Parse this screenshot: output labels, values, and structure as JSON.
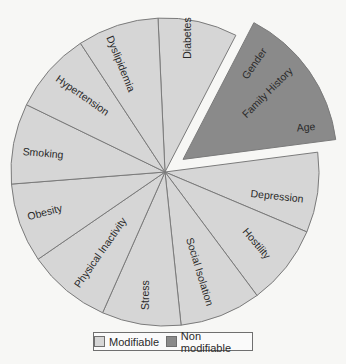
{
  "chart_data": {
    "type": "pie",
    "title": "",
    "center": [
      165,
      172
    ],
    "radius": 154,
    "exploded_offset": 22,
    "legend_position": "bottom",
    "categories": [
      "Modifiable",
      "Non modifiable"
    ],
    "colors": {
      "Modifiable": "#d6d6d6",
      "Non modifiable": "#8a8a8a"
    },
    "slices": [
      {
        "label": "Diabetes",
        "group": "Modifiable",
        "start_deg": -2.6,
        "end_deg": 27.4,
        "value": 1
      },
      {
        "label": "Gender / Family History / Age",
        "group": "Non modifiable",
        "start_deg": 27.4,
        "end_deg": 82.6,
        "value": 1.84,
        "exploded": true,
        "sub_labels": [
          "Gender",
          "Family History",
          "Age"
        ]
      },
      {
        "label": "Depression",
        "group": "Modifiable",
        "start_deg": 82.6,
        "end_deg": 112.9,
        "value": 1
      },
      {
        "label": "Hostility",
        "group": "Modifiable",
        "start_deg": 112.9,
        "end_deg": 143.3,
        "value": 1
      },
      {
        "label": "Social Isolation",
        "group": "Modifiable",
        "start_deg": 143.3,
        "end_deg": 174.0,
        "value": 1
      },
      {
        "label": "Stress",
        "group": "Modifiable",
        "start_deg": 174.0,
        "end_deg": 203.9,
        "value": 1
      },
      {
        "label": "Physical Inactivity",
        "group": "Modifiable",
        "start_deg": 203.9,
        "end_deg": 235.5,
        "value": 1
      },
      {
        "label": "Obesity",
        "group": "Modifiable",
        "start_deg": 235.5,
        "end_deg": 265.5,
        "value": 1
      },
      {
        "label": "Smoking",
        "group": "Modifiable",
        "start_deg": 265.5,
        "end_deg": 295.9,
        "value": 1
      },
      {
        "label": "Hypertension",
        "group": "Modifiable",
        "start_deg": 295.9,
        "end_deg": 326.7,
        "value": 1
      },
      {
        "label": "Dyslipidemia",
        "group": "Modifiable",
        "start_deg": 326.7,
        "end_deg": 357.4,
        "value": 1
      }
    ],
    "labels": [
      {
        "text": "Diabetes",
        "x": 188,
        "y": 38,
        "rotate": -90
      },
      {
        "text": "Dyslipidemia",
        "x": 120,
        "y": 64,
        "rotate": 68
      },
      {
        "text": "Hypertension",
        "x": 82,
        "y": 96,
        "rotate": 35
      },
      {
        "text": "Smoking",
        "x": 43,
        "y": 154,
        "rotate": 5
      },
      {
        "text": "Obesity",
        "x": 45,
        "y": 213,
        "rotate": -15
      },
      {
        "text": "Physical Inactivity",
        "x": 101,
        "y": 253,
        "rotate": -55
      },
      {
        "text": "Stress",
        "x": 146,
        "y": 295,
        "rotate": -90
      },
      {
        "text": "Social Isolation",
        "x": 199,
        "y": 272,
        "rotate": 73
      },
      {
        "text": "Hostility",
        "x": 256,
        "y": 244,
        "rotate": 50
      },
      {
        "text": "Depression",
        "x": 277,
        "y": 197,
        "rotate": 6
      },
      {
        "text": "Gender",
        "x": 255,
        "y": 64,
        "rotate": -55
      },
      {
        "text": "Family History",
        "x": 268,
        "y": 93,
        "rotate": -45
      },
      {
        "text": "Age",
        "x": 306,
        "y": 128,
        "rotate": -5
      }
    ]
  },
  "legend": {
    "items": [
      {
        "label": "Modifiable",
        "color": "#d6d6d6"
      },
      {
        "label": "Non modifiable",
        "color": "#8a8a8a"
      }
    ]
  }
}
